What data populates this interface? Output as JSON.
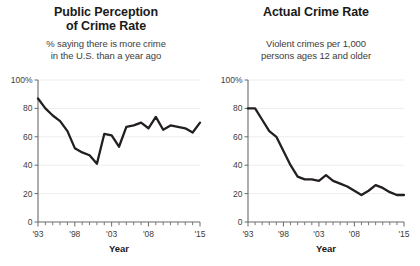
{
  "chart_data": [
    {
      "type": "line",
      "id": "public-perception",
      "title": "Public Perception of Crime Rate",
      "title_lines": [
        "Public Perception",
        "of Crime Rate"
      ],
      "subtitle": "% saying there is more crime in the U.S. than a year ago",
      "subtitle_lines": [
        "% saying there is more crime",
        "in the U.S. than a year ago"
      ],
      "xlabel": "Year",
      "ylabel": "",
      "ylim": [
        0,
        100
      ],
      "yticks": [
        0,
        20,
        40,
        60,
        80,
        100
      ],
      "ytick_labels": [
        "0",
        "20",
        "40",
        "60",
        "80",
        "100%"
      ],
      "xlim": [
        1993,
        2015
      ],
      "xticks": [
        1993,
        1998,
        2003,
        2008,
        2015
      ],
      "xtick_labels": [
        "'93",
        "'98",
        "'03",
        "'08",
        "'15"
      ],
      "grid": true,
      "legend": "none",
      "line_color": "#231f20",
      "x": [
        1993,
        1994,
        1995,
        1996,
        1997,
        1998,
        1999,
        2000,
        2001,
        2002,
        2003,
        2004,
        2005,
        2006,
        2007,
        2008,
        2009,
        2010,
        2011,
        2012,
        2013,
        2014,
        2015
      ],
      "values": [
        87,
        80,
        75,
        71,
        64,
        52,
        49,
        47,
        41,
        62,
        61,
        53,
        67,
        68,
        70,
        66,
        74,
        65,
        68,
        67,
        66,
        63,
        70
      ]
    },
    {
      "type": "line",
      "id": "actual-crime-rate",
      "title": "Actual Crime Rate",
      "title_lines": [
        "Actual Crime Rate"
      ],
      "subtitle": "Violent crimes per 1,000 persons ages 12 and older",
      "subtitle_lines": [
        "Violent crimes per 1,000",
        "persons ages 12 and older"
      ],
      "xlabel": "Year",
      "ylabel": "",
      "ylim": [
        0,
        100
      ],
      "yticks": [
        0,
        20,
        40,
        60,
        80,
        100
      ],
      "ytick_labels": [
        "0",
        "20",
        "40",
        "60",
        "80",
        "100%"
      ],
      "xlim": [
        1993,
        2015
      ],
      "xticks": [
        1993,
        1998,
        2003,
        2008,
        2015
      ],
      "xtick_labels": [
        "'93",
        "'98",
        "'03",
        "'08",
        "'15"
      ],
      "grid": true,
      "legend": "none",
      "line_color": "#231f20",
      "x": [
        1993,
        1994,
        1995,
        1996,
        1997,
        1998,
        1999,
        2000,
        2001,
        2002,
        2003,
        2004,
        2005,
        2006,
        2007,
        2008,
        2009,
        2010,
        2011,
        2012,
        2013,
        2014,
        2015
      ],
      "values": [
        80,
        80,
        72,
        64,
        60,
        50,
        40,
        32,
        30,
        30,
        29,
        33,
        29,
        27,
        25,
        22,
        19,
        22,
        26,
        24,
        21,
        19,
        19
      ]
    }
  ],
  "charts": {
    "left": {
      "title_line1": "Public Perception",
      "title_line2": "of Crime Rate",
      "subtitle_line1": "% saying there is more crime",
      "subtitle_line2": "in the U.S. than a year ago",
      "xlabel": "Year"
    },
    "right": {
      "title_line1": "Actual Crime Rate",
      "subtitle_line1": "Violent crimes per 1,000",
      "subtitle_line2": "persons ages 12 and older",
      "xlabel": "Year"
    }
  },
  "colors": {
    "line": "#231f20",
    "grid": "#ededed",
    "axis": "#6b6b6b",
    "text": "#1a1a1a",
    "subtext": "#3d3d3d",
    "background": "#ffffff"
  }
}
